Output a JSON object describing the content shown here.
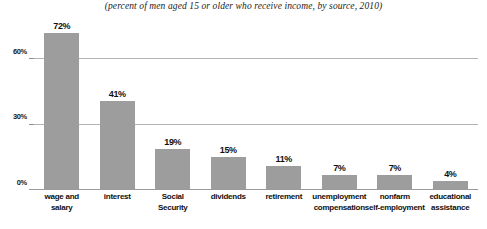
{
  "chart_data": {
    "type": "bar",
    "title": "",
    "subtitle": "(percent of men aged 15 or older who receive income, by source, 2010)",
    "xlabel": "",
    "ylabel": "",
    "ylim": [
      0,
      78
    ],
    "grid": true,
    "legend": false,
    "yticks": [
      "0%",
      "30%",
      "60%"
    ],
    "ytick_values": [
      0,
      30,
      60
    ],
    "categories": [
      "wage and salary",
      "interest",
      "Social Security",
      "dividends",
      "retirement",
      "unemployment compensation",
      "nonfarm self-employment",
      "educational assistance"
    ],
    "category_lines": [
      [
        "wage and",
        "salary"
      ],
      [
        "interest"
      ],
      [
        "Social",
        "Security"
      ],
      [
        "dividends"
      ],
      [
        "retirement"
      ],
      [
        "unemployment",
        "compensation"
      ],
      [
        "nonfarm",
        "self-employment"
      ],
      [
        "educational",
        "assistance"
      ]
    ],
    "values": [
      72,
      41,
      19,
      15,
      11,
      7,
      7,
      4
    ],
    "data_labels": [
      "72%",
      "41%",
      "19%",
      "15%",
      "11%",
      "7%",
      "7%",
      "4%"
    ],
    "colors": {
      "bar": "#9d9d9d",
      "gridline": "#b4b4b4",
      "axis": "#9a9a9a",
      "text": "#101010",
      "background": "#ffffff"
    }
  }
}
